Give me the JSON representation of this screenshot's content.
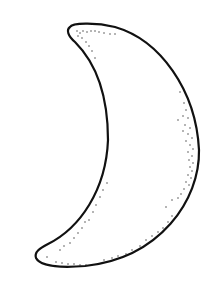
{
  "image": {
    "subject": "crescent moon line drawing",
    "background_color": "#ffffff",
    "stroke_color": "#111111",
    "stipple_color": "#333333"
  }
}
